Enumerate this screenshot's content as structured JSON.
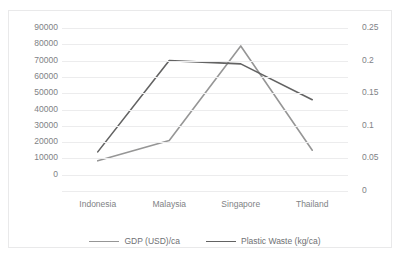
{
  "chart_data": {
    "type": "line",
    "title": "",
    "xlabel": "",
    "categories": [
      "Indonesia",
      "Malaysia",
      "Singapore",
      "Thailand"
    ],
    "series": [
      {
        "name": "GDP (USD)/ca",
        "axis": "left",
        "color": "#969696",
        "values": [
          8500,
          21000,
          79000,
          15000
        ]
      },
      {
        "name": "Plastic Waste (kg/ca)",
        "axis": "right",
        "color": "#636363",
        "values": [
          0.06,
          0.2,
          0.195,
          0.14
        ]
      }
    ],
    "y_left": {
      "label": "GDP (USD)/ca",
      "min": 0,
      "max": 90000,
      "step": 10000,
      "ticks": [
        "0",
        "10000",
        "20000",
        "30000",
        "40000",
        "50000",
        "60000",
        "70000",
        "80000",
        "90000"
      ]
    },
    "y_right": {
      "label": "Plastic Waste (kg/ca)",
      "min": 0,
      "max": 0.25,
      "step": 0.05,
      "ticks": [
        "0",
        "0.05",
        "0.1",
        "0.15",
        "0.2",
        "0.25"
      ]
    },
    "grid": true,
    "gridline_count": 11,
    "legend_position": "bottom"
  }
}
